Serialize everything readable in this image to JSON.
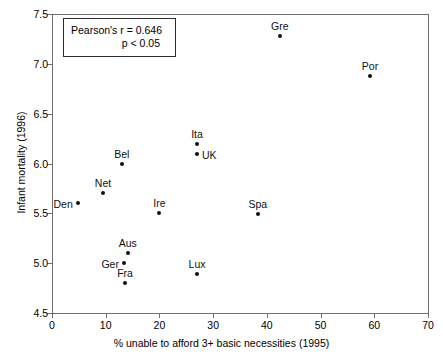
{
  "chart_data": {
    "type": "scatter",
    "title": "",
    "xlabel": "% unable to afford 3+ basic necessities (1995)",
    "ylabel": "Infant mortality  (1996)",
    "xlim": [
      0,
      70
    ],
    "ylim": [
      4.5,
      7.5
    ],
    "xticks": [
      "0",
      "10",
      "20",
      "30",
      "40",
      "50",
      "60",
      "70"
    ],
    "yticks": [
      "4.5",
      "5.0",
      "5.5",
      "6.0",
      "6.5",
      "7.0",
      "7.5"
    ],
    "grid": false,
    "legend": "none",
    "points": [
      {
        "label": "Den",
        "x": 4.8,
        "y": 5.6,
        "label_pos": "left"
      },
      {
        "label": "Net",
        "x": 9.5,
        "y": 5.7,
        "label_pos": "above"
      },
      {
        "label": "Bel",
        "x": 13.0,
        "y": 6.0,
        "label_pos": "above"
      },
      {
        "label": "Ger",
        "x": 13.4,
        "y": 5.0,
        "label_pos": "left"
      },
      {
        "label": "Fra",
        "x": 13.6,
        "y": 4.8,
        "label_pos": "above"
      },
      {
        "label": "Aus",
        "x": 14.1,
        "y": 5.1,
        "label_pos": "above"
      },
      {
        "label": "Ire",
        "x": 20.0,
        "y": 5.5,
        "label_pos": "above"
      },
      {
        "label": "Lux",
        "x": 27.0,
        "y": 4.89,
        "label_pos": "above"
      },
      {
        "label": "UK",
        "x": 27.0,
        "y": 6.1,
        "label_pos": "right"
      },
      {
        "label": "Ita",
        "x": 27.0,
        "y": 6.2,
        "label_pos": "above"
      },
      {
        "label": "Spa",
        "x": 38.3,
        "y": 5.49,
        "label_pos": "above"
      },
      {
        "label": "Gre",
        "x": 42.4,
        "y": 7.28,
        "label_pos": "above"
      },
      {
        "label": "Por",
        "x": 59.2,
        "y": 6.88,
        "label_pos": "above"
      }
    ],
    "annotations": [
      {
        "line1": "Pearson's r = 0.646",
        "line2": "p < 0.05"
      }
    ]
  },
  "statistics": {
    "pearson_r_label": "Pearson's r = 0.646",
    "p_value_label": "p < 0.05"
  }
}
